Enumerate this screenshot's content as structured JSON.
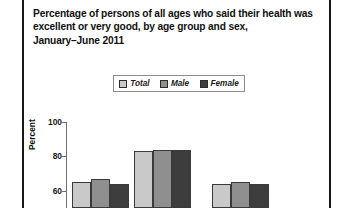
{
  "title": {
    "lines": [
      "Percentage of persons of all ages who said their health was",
      "excellent or very good, by age group and sex,",
      "January–June 2011"
    ]
  },
  "legend": {
    "items": [
      {
        "label": "Total",
        "color": "#c9c9c9"
      },
      {
        "label": "Male",
        "color": "#8f8f8f"
      },
      {
        "label": "Female",
        "color": "#3d3d3d"
      }
    ]
  },
  "axis": {
    "y_title": "Percent",
    "y_ticks": [
      "100",
      "80",
      "60"
    ]
  },
  "chart_data": {
    "type": "bar",
    "title": "Percentage of persons of all ages who said their health was excellent or very good, by age group and sex, January–June 2011",
    "xlabel": "",
    "ylabel": "Percent",
    "ylim": [
      50,
      100
    ],
    "yticks": [
      60,
      80,
      100
    ],
    "grid": false,
    "legend_position": "top-center",
    "categories": [
      "group-1",
      "group-2",
      "group-3"
    ],
    "series": [
      {
        "name": "Total",
        "values": [
          65,
          83,
          64
        ]
      },
      {
        "name": "Male",
        "values": [
          67,
          84,
          65
        ]
      },
      {
        "name": "Female",
        "values": [
          64,
          84,
          64
        ]
      }
    ]
  }
}
